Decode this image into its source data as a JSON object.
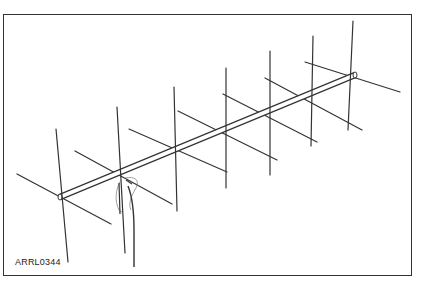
{
  "figure": {
    "label": "ARRL0344",
    "colors": {
      "line": "#333333",
      "frame": "#333333",
      "background": "#ffffff"
    },
    "boom": {
      "start": [
        60,
        197
      ],
      "end": [
        355,
        75
      ]
    },
    "elements": [
      {
        "id": 1,
        "vertical": [
          [
            56,
            129
          ],
          [
            68,
            262
          ]
        ],
        "horizontal": [
          [
            17,
            174
          ],
          [
            111,
            224
          ]
        ]
      },
      {
        "id": 2,
        "vertical": [
          [
            117,
            107
          ],
          [
            125,
            253
          ]
        ],
        "horizontal": [
          [
            75,
            151
          ],
          [
            172,
            204
          ]
        ]
      },
      {
        "id": 3,
        "vertical": [
          [
            174,
            87
          ],
          [
            177,
            211
          ]
        ],
        "horizontal": [
          [
            129,
            129
          ],
          [
            227,
            172
          ]
        ]
      },
      {
        "id": 4,
        "vertical": [
          [
            226,
            68
          ],
          [
            226,
            188
          ]
        ],
        "horizontal": [
          [
            178,
            111
          ],
          [
            277,
            160
          ]
        ]
      },
      {
        "id": 5,
        "vertical": [
          [
            270,
            51
          ],
          [
            270,
            175
          ]
        ],
        "horizontal": [
          [
            223,
            94
          ],
          [
            317,
            142
          ]
        ]
      },
      {
        "id": 6,
        "vertical": [
          [
            313,
            36
          ],
          [
            311,
            146
          ]
        ],
        "horizontal": [
          [
            265,
            78
          ],
          [
            362,
            130
          ]
        ]
      },
      {
        "id": 7,
        "vertical": [
          [
            353,
            21
          ],
          [
            348,
            130
          ]
        ],
        "horizontal": [
          [
            305,
            62
          ],
          [
            400,
            92
          ]
        ]
      }
    ]
  }
}
